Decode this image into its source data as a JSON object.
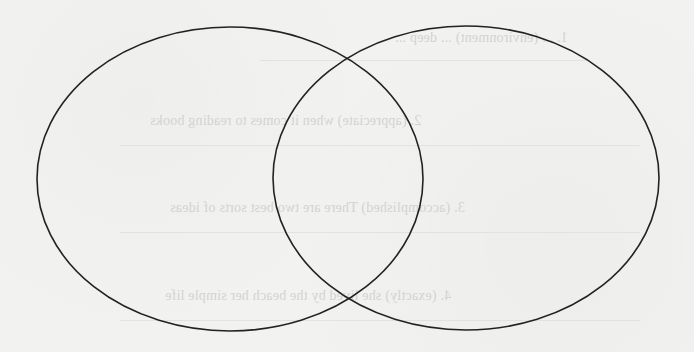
{
  "diagram": {
    "type": "venn",
    "sets": [
      {
        "id": "left",
        "label": ""
      },
      {
        "id": "right",
        "label": ""
      }
    ],
    "stroke_color": "#222222",
    "background_color": "#f2f2f1",
    "geometry": {
      "left": {
        "cx": 230,
        "cy": 179,
        "rx": 193,
        "ry": 152
      },
      "right": {
        "cx": 466,
        "cy": 178,
        "rx": 193,
        "ry": 152
      }
    }
  },
  "bleed_through_text": {
    "note_color": "#d3d3d1",
    "lines": [
      {
        "text": "1. ... (environment) ... deep ...",
        "x": 395,
        "y": 36,
        "w": 190
      },
      {
        "text": "2. (appreciate) when it comes to reading books",
        "x": 150,
        "y": 121,
        "w": 300
      },
      {
        "text": "3. (accomplished) There are two best sorts of ideas",
        "x": 170,
        "y": 208,
        "w": 320
      },
      {
        "text": "4. (exactly) she lived by the beach her simple life",
        "x": 165,
        "y": 296,
        "w": 310
      }
    ]
  }
}
